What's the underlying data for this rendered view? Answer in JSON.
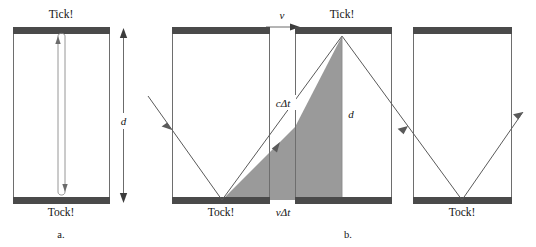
{
  "figure": {
    "title_caption": "",
    "colors": {
      "mirror": "#4a4a4a",
      "shaded_triangle": "#9a9a9a",
      "wall_outline": "#6e6e6e",
      "ray": "#5a5a5a",
      "background": "#ffffff"
    }
  },
  "panel_a": {
    "label": "a.",
    "top_label": "Tick!",
    "bottom_label": "Tock!",
    "distance_label": "d",
    "description": "Light clock at rest: light travels straight up and down between two mirrors separated by distance d."
  },
  "panel_b": {
    "label": "b.",
    "velocity_label": "v",
    "top_label": "Tick!",
    "bottom_label_left": "Tock!",
    "bottom_label_right": "Tock!",
    "hypotenuse_label": "cΔt",
    "vertical_label": "d",
    "base_label": "vΔt",
    "description": "Moving light clock: light traces a diagonal path of length cΔt while the clock moves a distance vΔt; the mirror separation remains d."
  }
}
